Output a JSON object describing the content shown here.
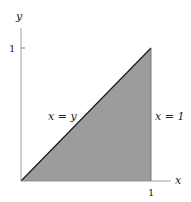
{
  "diagram": {
    "axes": {
      "x_label": "x",
      "y_label": "y",
      "x_tick_label": "1",
      "y_tick_label": "1"
    },
    "region": {
      "description": "shaded triangle with vertices (0,0), (1,0), (1,1)",
      "fill": "#9c9c9c"
    },
    "lines": [
      {
        "label": "x = y"
      },
      {
        "label": "x = 1"
      }
    ]
  }
}
